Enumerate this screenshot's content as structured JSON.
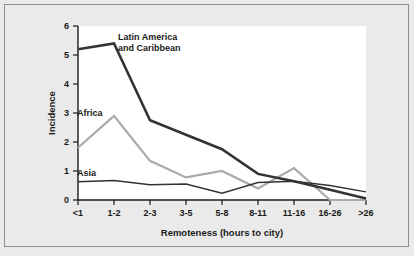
{
  "figure": {
    "background_color": "#eaeaea",
    "border_color": "#8e8e8e",
    "plot_background_color": "#ffffff"
  },
  "chart_data": {
    "type": "line",
    "title": "",
    "subtitle": "",
    "xlabel": "Remoteness (hours to city)",
    "ylabel": "Incidence",
    "categories": [
      "<1",
      "1-2",
      "2-3",
      "3-5",
      "5-8",
      "8-11",
      "11-16",
      "16-26",
      ">26"
    ],
    "ylim": [
      0,
      6
    ],
    "yticks": [
      "0",
      "1",
      "2",
      "3",
      "4",
      "5",
      "6"
    ],
    "ytick_values": [
      0,
      1,
      2,
      3,
      4,
      5,
      6
    ],
    "grid": false,
    "legend": "inline-labels",
    "legend_position": "in-plot",
    "series": [
      {
        "name": "Latin America and Caribbean",
        "label_line1": "Latin America",
        "label_line2": "and Caribbean",
        "color": "#333333",
        "stroke_width": 2.6,
        "values": [
          5.2,
          5.4,
          2.75,
          2.25,
          1.75,
          0.9,
          0.65,
          0.35,
          0.05
        ]
      },
      {
        "name": "Africa",
        "label_line1": "Africa",
        "label_line2": "",
        "color": "#aaaaaa",
        "stroke_width": 2.2,
        "values": [
          1.8,
          2.9,
          1.35,
          0.78,
          1.0,
          0.4,
          1.1,
          0.0,
          0.0
        ]
      },
      {
        "name": "Asia",
        "label_line1": "Asia",
        "label_line2": "",
        "color": "#333333",
        "stroke_width": 1.5,
        "values": [
          0.63,
          0.67,
          0.53,
          0.55,
          0.23,
          0.6,
          0.65,
          0.5,
          0.28
        ]
      }
    ],
    "annotations": [
      {
        "text": "Latin America",
        "series": "Latin America and Caribbean"
      },
      {
        "text": "and Caribbean",
        "series": "Latin America and Caribbean"
      },
      {
        "text": "Africa",
        "series": "Africa"
      },
      {
        "text": "Asia",
        "series": "Asia"
      }
    ]
  }
}
